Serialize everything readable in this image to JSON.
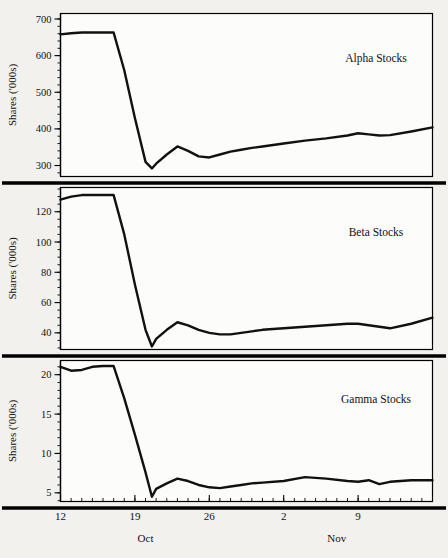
{
  "figure": {
    "background_color": "#f2f1ee",
    "plot_color": "#fcfcfa",
    "line_color": "#111111",
    "axis_title": "Shares ('000s)",
    "x_month_labels": [
      {
        "text": "Oct",
        "value": 20
      },
      {
        "text": "Nov",
        "value": 38
      }
    ],
    "x_tick_labels": [
      {
        "text": "12",
        "value": 12
      },
      {
        "text": "19",
        "value": 19
      },
      {
        "text": "26",
        "value": 26
      },
      {
        "text": "2",
        "value": 33
      },
      {
        "text": "9",
        "value": 40
      }
    ]
  },
  "chart_data": [
    {
      "type": "line",
      "title": "Alpha Stocks",
      "xlabel": "",
      "ylabel": "Shares ('000s)",
      "xlim": [
        12,
        47
      ],
      "ylim": [
        270,
        715
      ],
      "yticks": [
        300,
        400,
        500,
        600,
        700
      ],
      "ytick_minor_step": 20,
      "grid": false,
      "legend": "inline-right",
      "x": [
        12,
        13,
        14,
        15,
        16,
        17,
        18,
        19,
        20,
        20.6,
        21,
        22,
        23,
        24,
        25,
        26,
        27,
        28,
        29,
        30,
        31,
        33,
        35,
        37,
        39,
        40,
        41,
        42,
        43,
        45,
        47
      ],
      "values": [
        658,
        661,
        663,
        663,
        663,
        663,
        560,
        430,
        310,
        292,
        305,
        330,
        352,
        340,
        325,
        322,
        330,
        338,
        343,
        348,
        352,
        360,
        368,
        374,
        382,
        388,
        385,
        382,
        383,
        393,
        404
      ]
    },
    {
      "type": "line",
      "title": "Beta Stocks",
      "xlabel": "",
      "ylabel": "Shares ('000s)",
      "xlim": [
        12,
        47
      ],
      "ylim": [
        29,
        136
      ],
      "yticks": [
        40,
        60,
        80,
        100,
        120
      ],
      "ytick_minor_step": 5,
      "grid": false,
      "legend": "inline-right",
      "x": [
        12,
        13,
        14,
        15,
        16,
        17,
        18,
        19,
        20,
        20.6,
        21,
        22,
        23,
        24,
        25,
        26,
        27,
        28,
        29,
        30,
        31,
        33,
        35,
        37,
        39,
        40,
        41,
        42,
        43,
        45,
        47
      ],
      "values": [
        128,
        130,
        131,
        131,
        131,
        131,
        105,
        72,
        42,
        31,
        36,
        42,
        47,
        45,
        42,
        40,
        39,
        39,
        40,
        41,
        42,
        43,
        44,
        45,
        46,
        46,
        45,
        44,
        43,
        46,
        50
      ]
    },
    {
      "type": "line",
      "title": "Gamma Stocks",
      "xlabel": "",
      "ylabel": "Shares ('000s)",
      "xlim": [
        12,
        47
      ],
      "ylim": [
        3.9,
        21.8
      ],
      "yticks": [
        5,
        10,
        15,
        20
      ],
      "ytick_minor_step": 1,
      "grid": false,
      "legend": "inline-right",
      "x": [
        12,
        13,
        14,
        15,
        16,
        17,
        18,
        19,
        20,
        20.6,
        21,
        22,
        23,
        24,
        25,
        26,
        27,
        28,
        29,
        30,
        31,
        33,
        35,
        37,
        39,
        40,
        41,
        42,
        43,
        45,
        47
      ],
      "values": [
        21.0,
        20.5,
        20.6,
        21.0,
        21.1,
        21.1,
        17.0,
        12.4,
        7.6,
        4.5,
        5.5,
        6.2,
        6.8,
        6.5,
        6.0,
        5.7,
        5.6,
        5.8,
        6.0,
        6.2,
        6.3,
        6.5,
        7.0,
        6.8,
        6.5,
        6.4,
        6.6,
        6.1,
        6.4,
        6.6,
        6.6
      ]
    }
  ]
}
